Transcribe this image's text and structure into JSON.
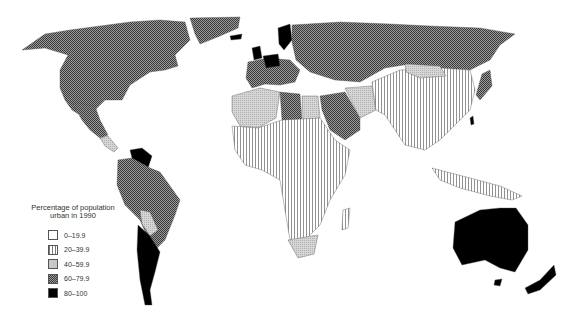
{
  "legend": {
    "title_line1": "Percentage of population",
    "title_line2": "urban in 1990",
    "items": [
      {
        "label": "0–19.9",
        "pattern": "white",
        "color": "#ffffff"
      },
      {
        "label": "20–39.9",
        "pattern": "vertical-stripes",
        "color": "#ffffff"
      },
      {
        "label": "40–59.9",
        "pattern": "light-stipple",
        "color": "#c8c8c8"
      },
      {
        "label": "60–79.9",
        "pattern": "crosshatch",
        "color": "#6e6e6e"
      },
      {
        "label": "80–100",
        "pattern": "solid",
        "color": "#000000"
      }
    ]
  },
  "map_data": {
    "type": "choropleth",
    "title": "Percentage of population urban in 1990",
    "regions": [
      {
        "name": "North America (USA, Canada)",
        "class": "60–79.9"
      },
      {
        "name": "Greenland",
        "class": "60–79.9"
      },
      {
        "name": "Mexico",
        "class": "60–79.9"
      },
      {
        "name": "Central America",
        "class": "40–59.9"
      },
      {
        "name": "Venezuela",
        "class": "80–100"
      },
      {
        "name": "Brazil",
        "class": "60–79.9"
      },
      {
        "name": "Bolivia / Paraguay",
        "class": "40–59.9"
      },
      {
        "name": "Argentina / Chile / Uruguay",
        "class": "80–100"
      },
      {
        "name": "Iceland",
        "class": "80–100"
      },
      {
        "name": "United Kingdom",
        "class": "80–100"
      },
      {
        "name": "Germany / Benelux",
        "class": "80–100"
      },
      {
        "name": "Sweden",
        "class": "80–100"
      },
      {
        "name": "Western Europe",
        "class": "60–79.9"
      },
      {
        "name": "USSR",
        "class": "60–79.9"
      },
      {
        "name": "North Africa (Libya)",
        "class": "60–79.9"
      },
      {
        "name": "Algeria / Morocco / Egypt",
        "class": "40–59.9"
      },
      {
        "name": "Saudi Arabia",
        "class": "60–79.9"
      },
      {
        "name": "Iran",
        "class": "40–59.9"
      },
      {
        "name": "Sub-Saharan Africa",
        "class": "20–39.9"
      },
      {
        "name": "South Africa",
        "class": "40–59.9"
      },
      {
        "name": "Mongolia",
        "class": "40–59.9"
      },
      {
        "name": "China / India / Southeast Asia",
        "class": "20–39.9"
      },
      {
        "name": "Japan",
        "class": "60–79.9"
      },
      {
        "name": "Taiwan",
        "class": "80–100"
      },
      {
        "name": "Australia",
        "class": "80–100"
      },
      {
        "name": "New Zealand",
        "class": "80–100"
      }
    ]
  }
}
